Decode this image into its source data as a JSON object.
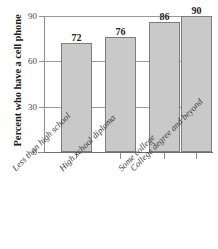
{
  "chart_data": {
    "type": "bar",
    "title": "",
    "xlabel": "",
    "ylabel": "Percent who have a cell phone",
    "categories": [
      "Less than high school",
      "High school diploma",
      "Some college",
      "College degree and beyond"
    ],
    "values": [
      72,
      76,
      86,
      90
    ],
    "value_labels": [
      "72",
      "76",
      "86",
      "90"
    ],
    "ylim": [
      0,
      90
    ],
    "yticks": [
      0,
      30,
      60,
      90
    ],
    "ytick_labels": [
      "0",
      "30",
      "60",
      "90"
    ],
    "grid": true,
    "legend": "none",
    "colors": {
      "bar_fill": "#c9c9c9",
      "bar_edge": "#7d7d7d",
      "gridline": "#9a9a9a",
      "axis": "#8d8d8d",
      "text": "#232323",
      "background": "#ffffff"
    }
  }
}
